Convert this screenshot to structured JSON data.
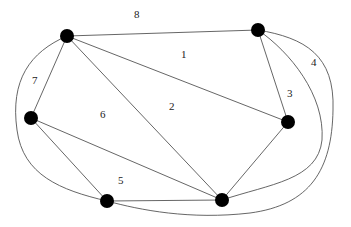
{
  "diagram": {
    "type": "graph",
    "directed": false,
    "nodes": [
      {
        "id": "A",
        "x": 67,
        "y": 36
      },
      {
        "id": "B",
        "x": 258,
        "y": 30
      },
      {
        "id": "C",
        "x": 288,
        "y": 122
      },
      {
        "id": "D",
        "x": 31,
        "y": 118
      },
      {
        "id": "E",
        "x": 222,
        "y": 200
      },
      {
        "id": "F",
        "x": 107,
        "y": 201
      }
    ],
    "edges": [
      {
        "from": "A",
        "to": "B",
        "shape": "straight"
      },
      {
        "from": "A",
        "to": "C",
        "shape": "straight"
      },
      {
        "from": "A",
        "to": "E",
        "shape": "straight"
      },
      {
        "from": "A",
        "to": "D",
        "shape": "straight"
      },
      {
        "from": "A",
        "to": "F",
        "shape": "curve-left"
      },
      {
        "from": "B",
        "to": "C",
        "shape": "straight"
      },
      {
        "from": "B",
        "to": "E",
        "shape": "curve-right-inner"
      },
      {
        "from": "B",
        "to": "F",
        "shape": "curve-right-outer"
      },
      {
        "from": "C",
        "to": "E",
        "shape": "straight"
      },
      {
        "from": "D",
        "to": "E",
        "shape": "straight"
      },
      {
        "from": "D",
        "to": "F",
        "shape": "straight"
      },
      {
        "from": "F",
        "to": "E",
        "shape": "straight"
      }
    ],
    "face_labels": [
      {
        "text": "8",
        "x": 137,
        "y": 18
      },
      {
        "text": "1",
        "x": 183,
        "y": 58
      },
      {
        "text": "2",
        "x": 171,
        "y": 110
      },
      {
        "text": "3",
        "x": 289,
        "y": 97
      },
      {
        "text": "4",
        "x": 313,
        "y": 66
      },
      {
        "text": "6",
        "x": 102,
        "y": 118
      },
      {
        "text": "7",
        "x": 34,
        "y": 84
      },
      {
        "text": "5",
        "x": 120,
        "y": 184
      }
    ]
  },
  "labels": {
    "l8": "8",
    "l1": "1",
    "l2": "2",
    "l3": "3",
    "l4": "4",
    "l6": "6",
    "l7": "7",
    "l5": "5"
  },
  "colors": {
    "edge": "#555555",
    "node": "#000000",
    "background": "#ffffff"
  }
}
